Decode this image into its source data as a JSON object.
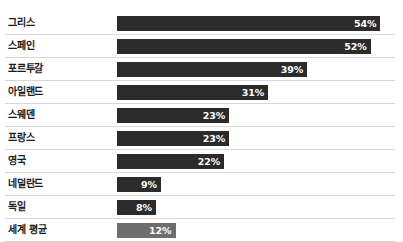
{
  "chart_data": {
    "type": "bar",
    "orientation": "horizontal",
    "title": "",
    "xlabel": "",
    "ylabel": "",
    "xlim": [
      0,
      57
    ],
    "grid": false,
    "value_suffix": "%",
    "legend": null,
    "categories": [
      "그리스",
      "스페인",
      "포르투갈",
      "아일랜드",
      "스웨덴",
      "프랑스",
      "영국",
      "네덜란드",
      "독일",
      "세계 평균"
    ],
    "values": [
      54,
      52,
      39,
      31,
      23,
      23,
      22,
      9,
      8,
      12
    ],
    "data_labels": [
      "54%",
      "52%",
      "39%",
      "31%",
      "23%",
      "23%",
      "22%",
      "9%",
      "8%",
      "12%"
    ],
    "bar_colors": [
      "#2b2b2b",
      "#2b2b2b",
      "#2b2b2b",
      "#2b2b2b",
      "#2b2b2b",
      "#2b2b2b",
      "#2b2b2b",
      "#2b2b2b",
      "#2b2b2b",
      "#6e6e6e"
    ],
    "highlight_index": 9,
    "separator_color": "#d8d8d8",
    "background": "#ffffff",
    "label_color": "#1b1b1b",
    "value_color": "#ffffff"
  }
}
